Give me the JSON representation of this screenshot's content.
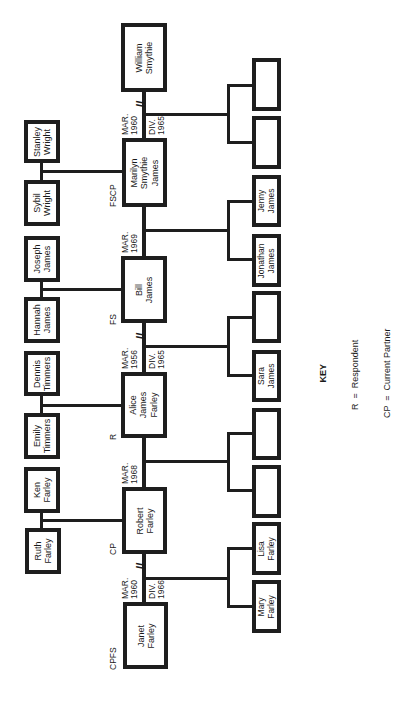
{
  "diagram": {
    "type": "genogram",
    "orientation": "rotated-90",
    "people": {
      "william_smythie": "William\nSmythie",
      "stanley_wright": "Stanley\nWright",
      "sybil_wright": "Sybil\nWright",
      "marilyn": "Marilyn\nSmythie\nJames",
      "joseph_james": "Joseph\nJames",
      "hannah_james": "Hannah\nJames",
      "bill": "Bill\nJames",
      "dennis_timmers": "Dennis\nTimmers",
      "emily_timmers": "Emily\nTimmers",
      "alice": "Alice\nJames\nFarley",
      "ken_farley": "Ken\nFarley",
      "ruth_farley": "Ruth\nFarley",
      "robert": "Robert\nFarley",
      "janet": "Janet\nFarley",
      "jenny": "Jenny\nJames",
      "jonathan": "Jonathan\nJames",
      "sara": "Sara\nJames",
      "lisa": "Lisa\nFarley",
      "mary": "Mary\nFarley"
    },
    "role_labels": {
      "marilyn": "FSCP",
      "bill": "FS",
      "alice": "R",
      "robert": "CP",
      "janet": "CPFS"
    },
    "relationships": {
      "william_marilyn_mar": "MAR.\n1960",
      "william_marilyn_div": "DIV.\n1965",
      "marilyn_bill_mar": "MAR.\n1969",
      "bill_alice_mar": "MAR.\n1956",
      "bill_alice_div": "DIV.\n1965",
      "alice_robert_mar": "MAR.\n1968",
      "robert_janet_mar": "MAR.\n1960",
      "robert_janet_div": "DIV.\n1966"
    },
    "key": {
      "title": "KEY",
      "line1": "R  =  Respondent",
      "line2": "CP  =  Current Partner"
    },
    "divorce_mark": "//"
  }
}
